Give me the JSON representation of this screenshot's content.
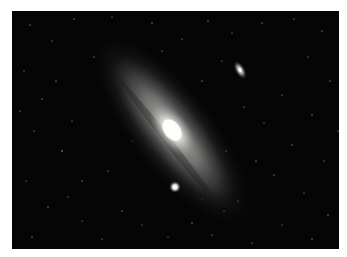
{
  "image": {
    "subject": "Andromeda Galaxy photograph",
    "alt": "Spiral galaxy seen at an oblique angle against a star field, with two small companion galaxies",
    "background_color": "#ffffff",
    "frame_color": "#050505",
    "galaxy": {
      "core_color": "#f4f4f0",
      "disk_color": "#8a8a88",
      "halo_color": "#3a3a3a",
      "center": [
        160,
        119
      ],
      "rotation_deg": 52
    },
    "companions": [
      {
        "name": "upper-right companion",
        "center": [
          228,
          59
        ],
        "color": "#d8d8d4"
      },
      {
        "name": "lower companion",
        "center": [
          163,
          176
        ],
        "color": "#ffffff"
      }
    ]
  }
}
